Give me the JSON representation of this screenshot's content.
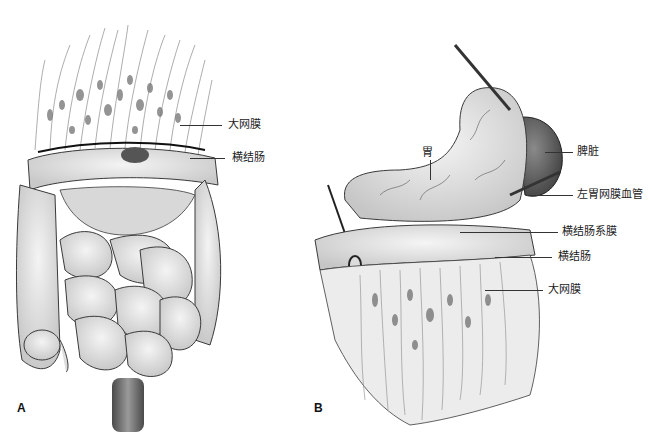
{
  "figure": {
    "panels": [
      {
        "id": "A",
        "letter": "A",
        "labels": [
          {
            "text": "大网膜",
            "meaning": "greater omentum"
          },
          {
            "text": "横结肠",
            "meaning": "transverse colon"
          }
        ]
      },
      {
        "id": "B",
        "letter": "B",
        "labels": [
          {
            "text": "胃",
            "meaning": "stomach"
          },
          {
            "text": "脾脏",
            "meaning": "spleen"
          },
          {
            "text": "左胃网膜血管",
            "meaning": "left gastroepiploic vessels"
          },
          {
            "text": "横结肠系膜",
            "meaning": "transverse mesocolon"
          },
          {
            "text": "横结肠",
            "meaning": "transverse colon"
          },
          {
            "text": "大网膜",
            "meaning": "greater omentum"
          }
        ]
      }
    ]
  },
  "colors": {
    "tissue": "#e6e6e6",
    "tissue_shadow": "#bdbdbd",
    "outline": "#3a3a3a",
    "fat_deposit": "#7a7a7a",
    "spleen": "#5e5e5e",
    "rectum": "#6b6b6b"
  }
}
